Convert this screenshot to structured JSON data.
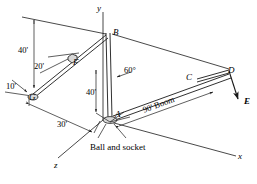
{
  "figure": {
    "kind": "statics-free-body-diagram",
    "caption_note": "Ball and socket",
    "stroke_color": "#1a1a1a",
    "background_color": "#ffffff"
  },
  "axes": [
    {
      "name": "y-axis",
      "label": "y",
      "x": 97,
      "y": 4
    },
    {
      "name": "x-axis",
      "label": "x",
      "x": 238,
      "y": 152
    },
    {
      "name": "z-axis",
      "label": "z",
      "x": 54,
      "y": 161
    }
  ],
  "points": [
    {
      "id": "B",
      "label": "B",
      "x": 113,
      "y": 28
    },
    {
      "id": "F",
      "label": "F",
      "x": 73,
      "y": 58
    },
    {
      "id": "G",
      "label": "G",
      "x": 29,
      "y": 93
    },
    {
      "id": "A",
      "label": "A",
      "x": 115,
      "y": 110
    },
    {
      "id": "C",
      "label": "C",
      "x": 186,
      "y": 73
    },
    {
      "id": "D",
      "label": "D",
      "x": 228,
      "y": 66
    },
    {
      "id": "E",
      "label": "E",
      "x": 240,
      "y": 103
    }
  ],
  "dimensions": [
    {
      "id": "mast-height",
      "label": "40'",
      "x": 18,
      "y": 46
    },
    {
      "id": "boom-vertical-offset",
      "label": "40'",
      "x": 86,
      "y": 88
    },
    {
      "id": "ground-offset",
      "label": "30'",
      "x": 57,
      "y": 120
    },
    {
      "id": "boom-length",
      "label": "90'  Boom",
      "x": 143,
      "y": 106,
      "rotate_deg": -9
    }
  ],
  "angles": [
    {
      "id": "cable-upper-angle",
      "label": "20'",
      "x": 34,
      "y": 62
    },
    {
      "id": "cable-lower-angle",
      "label": "10'",
      "x": 6,
      "y": 82
    },
    {
      "id": "boom-angle",
      "label": "60°",
      "x": 124,
      "y": 66
    }
  ],
  "forces": [
    {
      "id": "E-load",
      "label": "E",
      "x": 244,
      "y": 97
    }
  ],
  "annotations": [
    {
      "id": "ball-and-socket",
      "label": "Ball and socket",
      "x": 90,
      "y": 143
    }
  ]
}
